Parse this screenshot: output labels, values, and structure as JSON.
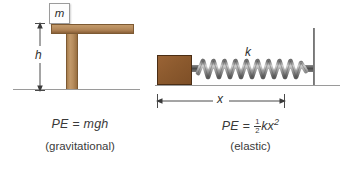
{
  "figure": {
    "title_alt": "Potential energy: gravitational and elastic",
    "background_color": "#ffffff",
    "panels": [
      {
        "id": "gravitational",
        "formula_prefix": "PE",
        "formula_equals": "=",
        "formula_body": "mgh",
        "caption": "(gravitational)",
        "labels": {
          "mass": "m",
          "height": "h"
        },
        "colors": {
          "wood_light": "#c39a6b",
          "wood_dark": "#8a6038",
          "ground": "#9a9a9a",
          "text": "#3a3a3a"
        }
      },
      {
        "id": "elastic",
        "formula_prefix": "PE",
        "formula_equals": "=",
        "formula_fraction_numerator": "1",
        "formula_fraction_denominator": "2",
        "formula_body": "kx",
        "formula_exponent": "2",
        "caption": "(elastic)",
        "labels": {
          "spring_constant": "k",
          "displacement": "x"
        },
        "colors": {
          "block": "#8c5a2e",
          "block_border": "#4a2d14",
          "spring": "#9a9a9a",
          "spring_dark": "#4d4d4d",
          "wall": "#7a7a7a",
          "ground": "#9a9a9a",
          "text": "#3a3a3a"
        }
      }
    ]
  }
}
